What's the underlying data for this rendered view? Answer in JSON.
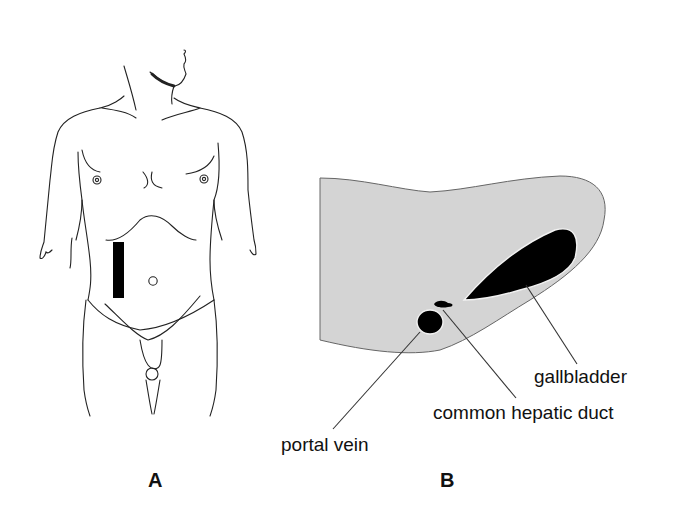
{
  "figure": {
    "panel_a": {
      "letter": "A",
      "subject": "male torso front view",
      "marker": "black vertical bar over right upper abdomen (transducer position)"
    },
    "panel_b": {
      "letter": "B",
      "subject": "liver cross-section",
      "labels": {
        "gallbladder": "gallbladder",
        "common_hepatic_duct": "common hepatic duct",
        "portal_vein": "portal vein"
      }
    },
    "colors": {
      "liver_fill": "#d3d3d3",
      "structure_fill": "#000000",
      "line": "#222222"
    }
  }
}
